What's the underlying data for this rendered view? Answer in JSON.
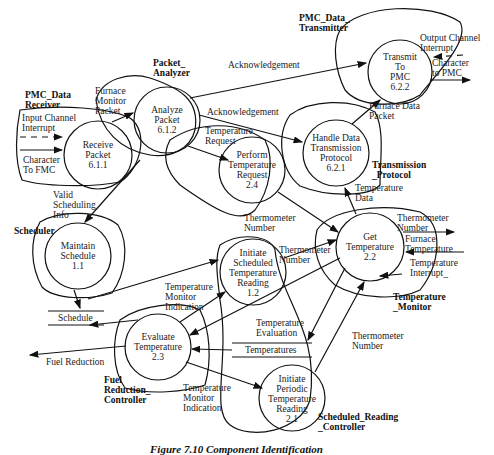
{
  "diagram": {
    "type": "data-flow-diagram",
    "caption": "Figure 7.10  Component Identification",
    "processes": [
      {
        "id": "6.1.1",
        "name": "Receive Packet",
        "lines": [
          "Receive",
          "Packet",
          "6.1.1"
        ]
      },
      {
        "id": "6.1.2",
        "name": "Analyze Packet",
        "lines": [
          "Analyze",
          "Packet",
          "6.1.2"
        ]
      },
      {
        "id": "6.2.2",
        "name": "Transmit To PMC",
        "lines": [
          "Transmit",
          "To",
          "PMC",
          "6.2.2"
        ]
      },
      {
        "id": "6.2.1",
        "name": "Handle Data Transmission Protocol",
        "lines": [
          "Handle Data",
          "Transmission",
          "Protocol",
          "6.2.1"
        ]
      },
      {
        "id": "2.4",
        "name": "Perform Temperature Request",
        "lines": [
          "Perform",
          "Temperature",
          "Request",
          "2.4"
        ]
      },
      {
        "id": "1.1",
        "name": "Maintain Schedule",
        "lines": [
          "Maintain",
          "Schedule",
          "1.1"
        ]
      },
      {
        "id": "2.2",
        "name": "Get Temperature",
        "lines": [
          "Get",
          "Temperature",
          "2.2"
        ]
      },
      {
        "id": "1.2",
        "name": "Initiate Scheduled Temperature Reading",
        "lines": [
          "Initiate",
          "Scheduled",
          "Temperature",
          "Reading",
          "1.2"
        ]
      },
      {
        "id": "2.3",
        "name": "Evaluate Temperature",
        "lines": [
          "Evaluate",
          "Temperature",
          "2.3"
        ]
      },
      {
        "id": "2.1",
        "name": "Initiate Periodic Temperature Reading",
        "lines": [
          "Initiate",
          "Periodic",
          "Temperature",
          "Reading",
          "2.1"
        ]
      }
    ],
    "components": [
      {
        "name": "PMC_Data_Receiver",
        "lines": [
          "PMC_Data",
          "Receiver"
        ]
      },
      {
        "name": "Packet_Analyzer",
        "lines": [
          "Packet_",
          "Analyzer"
        ]
      },
      {
        "name": "PMC_Data_Transmitter",
        "lines": [
          "PMC_Data_",
          "Transmitter"
        ]
      },
      {
        "name": "Transmission_Protocol",
        "lines": [
          "Transmission",
          "_Protocol"
        ]
      },
      {
        "name": "Scheduler",
        "lines": [
          "Scheduler"
        ]
      },
      {
        "name": "Temperature_Monitor",
        "lines": [
          "Temperature",
          "_Monitor"
        ]
      },
      {
        "name": "Fuel_Reduction_Controller",
        "lines": [
          "Fuel",
          "Reduction_",
          "Controller"
        ]
      },
      {
        "name": "Scheduled_Reading_Controller",
        "lines": [
          "Scheduled_Reading",
          "_Controller"
        ]
      }
    ],
    "stores": [
      {
        "name": "Schedule"
      },
      {
        "name": "Temperatures"
      }
    ],
    "flows": {
      "input_channel_interrupt": [
        "Input Channel",
        "Interrupt"
      ],
      "character_to_fmc": [
        "Character",
        "To FMC"
      ],
      "furnace_monitor_packet": [
        "Furnace",
        "Monitor",
        "Packet"
      ],
      "acknowledgement_top": "Acknowledgement",
      "acknowledgement_mid": "Acknowledgement",
      "temperature_request": [
        "Temperature",
        "Request"
      ],
      "output_channel_interrupt": [
        "Output Channel",
        "Interrupt"
      ],
      "character_to_pmc": [
        "Character",
        "to PMC"
      ],
      "furnace_data_packet": [
        "Furnace Data",
        "Packet"
      ],
      "temperature_data": [
        "Temperature",
        "Data"
      ],
      "valid_scheduling_info": [
        "Valid",
        "Scheduling",
        "Info"
      ],
      "thermometer_number_a": [
        "Thermometer",
        "Number"
      ],
      "thermometer_number_b": [
        "Thermometer",
        "Number"
      ],
      "thermometer_number_c": [
        "Thermometer",
        "Number"
      ],
      "thermometer_number_d": [
        "Thermometer",
        "Number"
      ],
      "furnace_temperature": [
        "Furnace",
        "Temperature"
      ],
      "temperature_interrupt": [
        "Temperature",
        "Interrupt_"
      ],
      "temperature_monitor_indication_a": [
        "Temperature",
        "Monitor",
        "Indication"
      ],
      "temperature_monitor_indication_b": [
        "Temperature",
        "Monitor",
        "Indication"
      ],
      "temperature_evaluation": [
        "Temperature",
        "Evaluation"
      ],
      "fuel_reduction": "Fuel Reduction"
    }
  }
}
